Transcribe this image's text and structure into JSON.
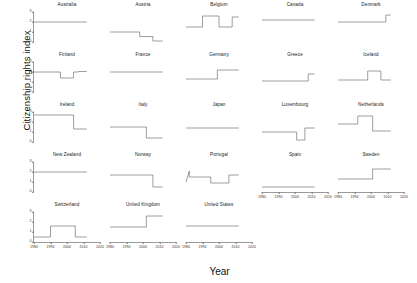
{
  "figure": {
    "ylabel": "Citizenship rights index",
    "xlabel": "Year"
  },
  "chart_data": {
    "type": "line",
    "title": "",
    "xlabel": "Year",
    "ylabel": "Citizenship rights index",
    "xlim": [
      1980,
      2020
    ],
    "ylim": [
      0,
      3
    ],
    "xticks": [
      1980,
      1990,
      2000,
      2010,
      2020
    ],
    "yticks": [
      0,
      1,
      2,
      3
    ],
    "grid": false,
    "legend": "none",
    "line_color": "#4d4d4d",
    "layout": {
      "rows": 5,
      "cols": 5,
      "shared_x": true,
      "shared_y": true
    },
    "panels": [
      {
        "name": "Australia",
        "x": [
          1980,
          2012
        ],
        "y": [
          2,
          2
        ]
      },
      {
        "name": "Austria",
        "x": [
          1980,
          1998,
          1998,
          2006,
          2006,
          2012
        ],
        "y": [
          1,
          1,
          0.55,
          0.55,
          0.1,
          0.1
        ]
      },
      {
        "name": "Belgium",
        "x": [
          1980,
          1990,
          1990,
          2000,
          2000,
          2008,
          2008,
          2012
        ],
        "y": [
          1.5,
          1.5,
          2.6,
          2.6,
          1.5,
          1.5,
          2.5,
          2.5
        ]
      },
      {
        "name": "Canada",
        "x": [
          1980,
          2012
        ],
        "y": [
          2.2,
          2.2
        ]
      },
      {
        "name": "Denmark",
        "x": [
          1980,
          2009,
          2009,
          2012
        ],
        "y": [
          2,
          2,
          2.7,
          2.7
        ]
      },
      {
        "name": "Finland",
        "x": [
          1980,
          1996,
          1996,
          2004,
          2004,
          2007,
          2007,
          2012
        ],
        "y": [
          2,
          2,
          1.4,
          1.4,
          2,
          2,
          2.05,
          2.05
        ]
      },
      {
        "name": "France",
        "x": [
          1980,
          2012
        ],
        "y": [
          2,
          2
        ]
      },
      {
        "name": "Germany",
        "x": [
          1980,
          1999,
          1999,
          2012
        ],
        "y": [
          1.3,
          1.3,
          2.2,
          2.2
        ]
      },
      {
        "name": "Greece",
        "x": [
          1980,
          2008,
          2008,
          2012
        ],
        "y": [
          1.1,
          1.1,
          1.8,
          1.8
        ]
      },
      {
        "name": "Iceland",
        "x": [
          1980,
          1998,
          1998,
          2006,
          2006,
          2012
        ],
        "y": [
          1.2,
          1.2,
          2.1,
          2.1,
          1.2,
          1.2
        ]
      },
      {
        "name": "Ireland",
        "x": [
          1980,
          2004,
          2004,
          2012
        ],
        "y": [
          2.7,
          2.7,
          1.3,
          1.3
        ]
      },
      {
        "name": "Italy",
        "x": [
          1980,
          2002,
          2002,
          2012
        ],
        "y": [
          1.5,
          1.5,
          0.4,
          0.4
        ]
      },
      {
        "name": "Japan",
        "x": [
          1980,
          2012
        ],
        "y": [
          1.4,
          1.4
        ]
      },
      {
        "name": "Luxembourg",
        "x": [
          1980,
          2001,
          2001,
          2006,
          2006,
          2012
        ],
        "y": [
          1.0,
          1.0,
          0.2,
          0.2,
          1.4,
          1.4
        ]
      },
      {
        "name": "Netherlands",
        "x": [
          1980,
          1992,
          1992,
          2001,
          2001,
          2012
        ],
        "y": [
          1.8,
          1.8,
          2.6,
          2.6,
          1.1,
          1.1
        ]
      },
      {
        "name": "New Zealand",
        "x": [
          1980,
          2012
        ],
        "y": [
          2,
          2
        ]
      },
      {
        "name": "Norway",
        "x": [
          1980,
          2006,
          2006,
          2012
        ],
        "y": [
          1.7,
          1.7,
          0.5,
          0.5
        ]
      },
      {
        "name": "Portugal",
        "x": [
          1980,
          1982,
          1982,
          1995,
          1995,
          2006,
          2006,
          2012
        ],
        "y": [
          1.0,
          2.1,
          1.5,
          1.5,
          0.9,
          0.9,
          1.7,
          1.7
        ]
      },
      {
        "name": "Spain",
        "x": [
          1980,
          2012
        ],
        "y": [
          0.5,
          0.5
        ]
      },
      {
        "name": "Sweden",
        "x": [
          1980,
          2001,
          2001,
          2012
        ],
        "y": [
          1.3,
          1.3,
          2.3,
          2.3
        ]
      },
      {
        "name": "Switzerland",
        "x": [
          1980,
          1990,
          1990,
          2005,
          2005,
          2012
        ],
        "y": [
          0.5,
          0.5,
          1.6,
          1.6,
          0.5,
          0.5
        ]
      },
      {
        "name": "United Kingdom",
        "x": [
          1980,
          2002,
          2002,
          2012
        ],
        "y": [
          1.5,
          1.5,
          2.6,
          2.6
        ]
      },
      {
        "name": "United States",
        "x": [
          1980,
          2012
        ],
        "y": [
          1.6,
          1.6
        ]
      }
    ]
  },
  "grid_layout": {
    "rows": [
      [
        "Australia",
        "Austria",
        "Belgium",
        "Canada",
        "Denmark"
      ],
      [
        "Finland",
        "France",
        "Germany",
        "Greece",
        "Iceland"
      ],
      [
        "Ireland",
        "Italy",
        "Japan",
        "Luxembourg",
        "Netherlands"
      ],
      [
        "New Zealand",
        "Norway",
        "Portugal",
        "Spain",
        "Sweden"
      ],
      [
        "Switzerland",
        "United Kingdom",
        "United States",
        null,
        null
      ]
    ]
  },
  "axes": {
    "yticklabels": [
      "0",
      "1",
      "2",
      "3"
    ],
    "xticklabels": [
      "1980",
      "1990",
      "2000",
      "2010",
      "2020"
    ]
  }
}
